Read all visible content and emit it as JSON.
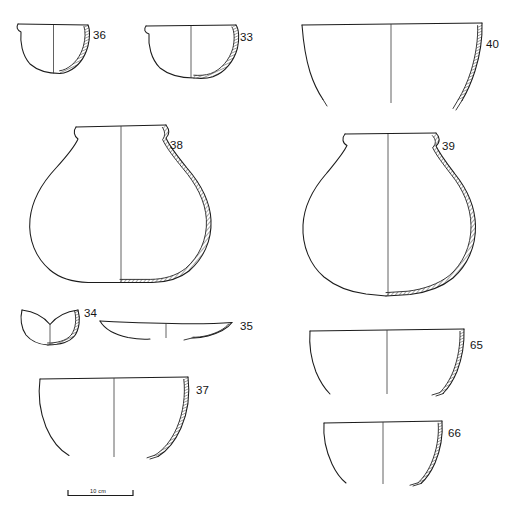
{
  "plate": {
    "title": "Pottery profile drawing plate",
    "background_color": "#ffffff",
    "ink_color": "#1c1c1c",
    "width": 507,
    "height": 511,
    "convention": "Left half shows exterior profile, right half shows hatched wall section; vertical line marks the vessel axis."
  },
  "scale": {
    "label": "10 cm",
    "bar_start_x": 68,
    "bar_end_x": 133,
    "bar_y": 495
  },
  "vessels": [
    {
      "id": "36",
      "label": "36",
      "form": "hemispherical-bowl",
      "description": "Small deep hemispherical bowl with slightly everted rim",
      "label_x": 93,
      "label_y": 39,
      "rim_left_x": 18,
      "rim_right_x": 88,
      "rim_y": 24,
      "base_y": 72
    },
    {
      "id": "33",
      "label": "33",
      "form": "hemispherical-bowl",
      "description": "Wide hemispherical bowl with slightly everted rim",
      "label_x": 240,
      "label_y": 41,
      "rim_left_x": 146,
      "rim_right_x": 236,
      "rim_y": 25,
      "base_y": 76
    },
    {
      "id": "40",
      "label": "40",
      "form": "open-flaring-bowl-fragment",
      "description": "Large open flaring bowl, lower body incomplete",
      "label_x": 486,
      "label_y": 48,
      "rim_left_x": 302,
      "rim_right_x": 482,
      "rim_y": 24,
      "base_y": 110
    },
    {
      "id": "38",
      "label": "38",
      "form": "carinated-jar",
      "description": "Large carinated jar, flaring rim, short neck, rounded shoulder, flattened base",
      "label_x": 170,
      "label_y": 149,
      "rim_left_x": 76,
      "rim_right_x": 166,
      "rim_y": 127,
      "base_y": 280
    },
    {
      "id": "39",
      "label": "39",
      "form": "carinated-jar",
      "description": "Large carinated jar with everted rim, broad shoulder and rounded lower body",
      "label_x": 442,
      "label_y": 150,
      "rim_left_x": 345,
      "rim_right_x": 436,
      "rim_y": 134,
      "base_y": 296
    },
    {
      "id": "34",
      "label": "34",
      "form": "small-bowl",
      "description": "Small bowl with concave dipped rim and rounded base",
      "label_x": 84,
      "label_y": 317,
      "rim_left_x": 22,
      "rim_right_x": 78,
      "rim_y": 310,
      "base_y": 345
    },
    {
      "id": "35",
      "label": "35",
      "form": "shallow-plate",
      "description": "Very shallow wide plate / platter profile",
      "label_x": 240,
      "label_y": 330,
      "rim_left_x": 100,
      "rim_right_x": 232,
      "rim_y": 322,
      "base_y": 338
    },
    {
      "id": "37",
      "label": "37",
      "form": "deep-open-bowl",
      "description": "Deep open bowl with flat rim, lower body incomplete",
      "label_x": 196,
      "label_y": 394,
      "rim_left_x": 40,
      "rim_right_x": 188,
      "rim_y": 379,
      "base_y": 455
    },
    {
      "id": "65",
      "label": "65",
      "form": "open-flaring-bowl-fragment",
      "description": "Open flaring bowl with straight rim, lower body incomplete",
      "label_x": 470,
      "label_y": 349,
      "rim_left_x": 310,
      "rim_right_x": 464,
      "rim_y": 330,
      "base_y": 392
    },
    {
      "id": "66",
      "label": "66",
      "form": "open-flaring-bowl-fragment",
      "description": "Open flaring bowl with straight rim, lower body incomplete",
      "label_x": 448,
      "label_y": 437,
      "rim_left_x": 324,
      "rim_right_x": 442,
      "rim_y": 422,
      "base_y": 482
    }
  ]
}
